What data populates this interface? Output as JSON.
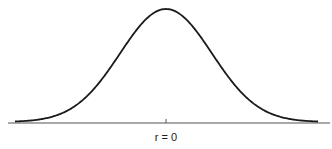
{
  "figure": {
    "curve": "normal distribution (bell curve)",
    "center_label": "r = 0",
    "colors": {
      "curve": "#1a1a1a",
      "axis": "#555555",
      "background": "#ffffff"
    }
  }
}
